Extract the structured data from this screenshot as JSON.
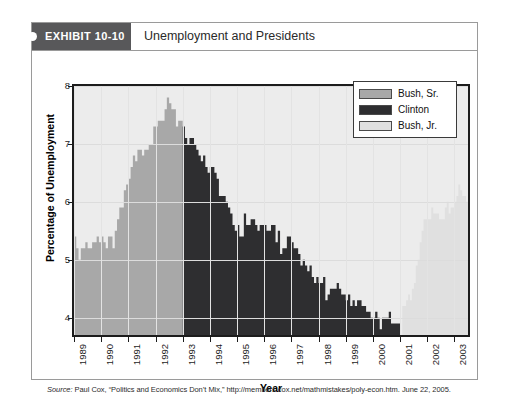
{
  "exhibit": {
    "tag": "EXHIBIT 10-10",
    "title": "Unemployment and Presidents"
  },
  "source": {
    "label": "Source:",
    "text": " Paul Cox, “Politics and Economics Don’t Mix,” http://members.cox.net/mathmistakes/poly-econ.htm. June 22, 2005."
  },
  "legend": {
    "items": [
      {
        "label": "Bush, Sr.",
        "color": "#a8a8a8"
      },
      {
        "label": "Clinton",
        "color": "#2e2e30"
      },
      {
        "label": "Bush, Jr.",
        "color": "#e0e0e0"
      }
    ]
  },
  "axes": {
    "y_title": "Percentage of Unemployment",
    "x_title": "Year",
    "y_ticks": [
      "4",
      "5",
      "6",
      "7",
      "8"
    ],
    "x_ticks": [
      "1989",
      "1990",
      "1991",
      "1992",
      "1993",
      "1994",
      "1995",
      "1996",
      "1997",
      "1998",
      "1999",
      "2000",
      "2001",
      "2002",
      "2003"
    ]
  },
  "chart_data": {
    "type": "area",
    "title": "Unemployment and Presidents",
    "xlabel": "Year",
    "ylabel": "Percentage of Unemployment",
    "xlim": [
      1989.0,
      2003.5
    ],
    "ylim": [
      3.7,
      8.0
    ],
    "ytick_values": [
      4,
      5,
      6,
      7,
      8
    ],
    "grid": true,
    "legend_position": "top-right",
    "x_unit": "monthly",
    "series": [
      {
        "name": "Bush, Sr.",
        "color": "#a8a8a8",
        "x_start": 1989.0,
        "x_end": 1993.0,
        "values": [
          5.4,
          5.2,
          5.0,
          5.2,
          5.2,
          5.3,
          5.2,
          5.2,
          5.3,
          5.3,
          5.4,
          5.3,
          5.4,
          5.3,
          5.2,
          5.4,
          5.4,
          5.2,
          5.5,
          5.7,
          5.9,
          5.9,
          6.2,
          6.3,
          6.4,
          6.6,
          6.8,
          6.7,
          6.9,
          6.9,
          6.8,
          6.9,
          6.9,
          7.0,
          7.0,
          7.3,
          7.3,
          7.4,
          7.4,
          7.4,
          7.6,
          7.8,
          7.7,
          7.6,
          7.6,
          7.3,
          7.4,
          7.4
        ]
      },
      {
        "name": "Clinton",
        "color": "#2e2e30",
        "x_start": 1993.0,
        "x_end": 2001.0,
        "values": [
          7.3,
          7.1,
          7.0,
          7.1,
          7.1,
          7.0,
          6.9,
          6.8,
          6.7,
          6.8,
          6.6,
          6.5,
          6.6,
          6.6,
          6.5,
          6.4,
          6.1,
          6.1,
          6.1,
          6.0,
          5.9,
          5.8,
          5.6,
          5.5,
          5.6,
          5.4,
          5.4,
          5.8,
          5.6,
          5.6,
          5.7,
          5.7,
          5.6,
          5.5,
          5.6,
          5.6,
          5.6,
          5.5,
          5.5,
          5.6,
          5.6,
          5.3,
          5.5,
          5.1,
          5.2,
          5.2,
          5.4,
          5.4,
          5.3,
          5.2,
          5.2,
          5.1,
          4.9,
          5.0,
          4.9,
          4.8,
          4.9,
          4.7,
          4.6,
          4.7,
          4.6,
          4.6,
          4.7,
          4.3,
          4.4,
          4.5,
          4.5,
          4.5,
          4.6,
          4.5,
          4.4,
          4.4,
          4.3,
          4.4,
          4.2,
          4.3,
          4.2,
          4.3,
          4.3,
          4.2,
          4.2,
          4.1,
          4.1,
          4.0,
          4.0,
          4.1,
          4.0,
          3.8,
          4.0,
          4.0,
          4.0,
          4.1,
          3.9,
          3.9,
          3.9,
          3.9
        ]
      },
      {
        "name": "Bush, Jr.",
        "color": "#e0e0e0",
        "x_start": 2001.08,
        "x_end": 2003.5,
        "values": [
          4.2,
          4.2,
          4.3,
          4.4,
          4.3,
          4.5,
          4.6,
          4.9,
          5.0,
          5.3,
          5.5,
          5.7,
          5.7,
          5.7,
          5.7,
          5.9,
          5.8,
          5.8,
          5.8,
          5.7,
          5.7,
          5.7,
          5.9,
          6.0,
          5.8,
          5.9,
          5.9,
          6.0,
          6.1,
          6.3,
          6.2,
          6.1,
          6.1,
          6.0
        ]
      }
    ]
  }
}
